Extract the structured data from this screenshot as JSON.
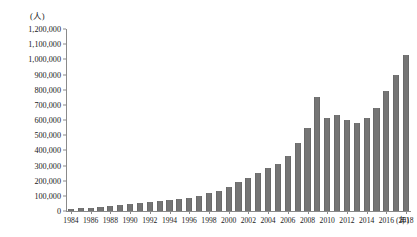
{
  "chart_data": {
    "type": "bar",
    "title": "",
    "xlabel": "(年)",
    "ylabel": "(人)",
    "ylim": [
      0,
      1200000
    ],
    "ytick_step": 100000,
    "grid": false,
    "legend": null,
    "bar_color": "#757575",
    "axis_color": "#8a8a8a",
    "ytick_labels": [
      "1,200,000",
      "1,100,000",
      "1,000,000",
      "900,000",
      "800,000",
      "700,000",
      "600,000",
      "500,000",
      "400,000",
      "300,000",
      "200,000",
      "100,000",
      "0"
    ],
    "ytick_values": [
      1200000,
      1100000,
      1000000,
      900000,
      800000,
      700000,
      600000,
      500000,
      400000,
      300000,
      200000,
      100000,
      0
    ],
    "categories": [
      "1984",
      "1985",
      "1986",
      "1987",
      "1988",
      "1989",
      "1990",
      "1991",
      "1992",
      "1993",
      "1994",
      "1995",
      "1996",
      "1997",
      "1998",
      "1999",
      "2000",
      "2001",
      "2002",
      "2003",
      "2004",
      "2005",
      "2006",
      "2007",
      "2008",
      "2009",
      "2010",
      "2011",
      "2012",
      "2013",
      "2014",
      "2015",
      "2016",
      "2017",
      "2018"
    ],
    "xtick_labels": [
      "1984",
      "1986",
      "1988",
      "1990",
      "1992",
      "1994",
      "1996",
      "1998",
      "2000",
      "2002",
      "2004",
      "2006",
      "2008",
      "2010",
      "2012",
      "2014",
      "2016",
      "2018"
    ],
    "values": [
      14000,
      17000,
      21000,
      26000,
      32000,
      38000,
      45000,
      52000,
      60000,
      68000,
      75000,
      80000,
      86000,
      100000,
      118000,
      130000,
      160000,
      190000,
      215000,
      250000,
      285000,
      310000,
      360000,
      450000,
      545000,
      750000,
      610000,
      630000,
      600000,
      580000,
      610000,
      680000,
      790000,
      900000,
      1030000
    ]
  }
}
